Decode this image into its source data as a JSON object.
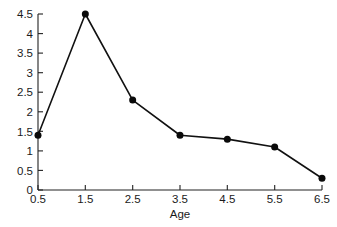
{
  "chart_data": {
    "type": "line",
    "title": "",
    "subtitle": "",
    "xlabel": "Age",
    "ylabel": "",
    "x": [
      0.5,
      1.5,
      2.5,
      3.5,
      4.5,
      5.5,
      6.5
    ],
    "values": [
      1.4,
      4.5,
      2.3,
      1.4,
      1.3,
      1.1,
      0.3
    ],
    "series": [
      {
        "name": "",
        "values": [
          1.4,
          4.5,
          2.3,
          1.4,
          1.3,
          1.1,
          0.3
        ]
      }
    ],
    "xlim": [
      0.5,
      6.5
    ],
    "ylim": [
      0,
      4.5
    ],
    "xticks": [
      0.5,
      1.5,
      2.5,
      3.5,
      4.5,
      5.5,
      6.5
    ],
    "xtick_labels": [
      "0.5",
      "1.5",
      "2.5",
      "3.5",
      "4.5",
      "5.5",
      "6.5"
    ],
    "yticks": [
      0,
      0.5,
      1,
      1.5,
      2,
      2.5,
      3,
      3.5,
      4,
      4.5
    ],
    "ytick_labels": [
      "0",
      "0.5",
      "1",
      "1.5",
      "2",
      "2.5",
      "3",
      "3.5",
      "4",
      "4.5"
    ],
    "grid": false,
    "legend": false,
    "legend_position": "none",
    "annotations": [],
    "marker": "filled-circle",
    "line_color": "#111111",
    "marker_color": "#0a0a0a",
    "axis_color": "#222222",
    "background_color": "#ffffff"
  },
  "axes": {
    "x_title": "Age",
    "y_title": ""
  }
}
